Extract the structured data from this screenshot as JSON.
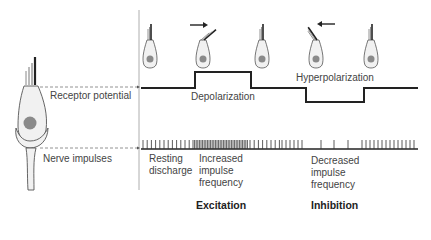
{
  "labels": {
    "receptor_potential": "Receptor potential",
    "nerve_impulses": "Nerve impulses",
    "depolarization": "Depolarization",
    "hyperpolarization": "Hyperpolarization",
    "resting_line1": "Resting",
    "resting_line2": "discharge",
    "increased_line1": "Increased",
    "increased_line2": "impulse",
    "increased_line3": "frequency",
    "decreased_line1": "Decreased",
    "decreased_line2": "impulse",
    "decreased_line3": "frequency",
    "excitation": "Excitation",
    "inhibition": "Inhibition"
  },
  "colors": {
    "line": "#222222",
    "cell_fill": "#f1f1f1",
    "nucleus": "#8a8a8a",
    "dashed": "#777777"
  },
  "hair_cells": [
    {
      "x": 150,
      "state": "rest",
      "arrow": "none"
    },
    {
      "x": 203,
      "state": "deflected-right",
      "arrow": "right"
    },
    {
      "x": 262,
      "state": "rest",
      "arrow": "none"
    },
    {
      "x": 316,
      "state": "deflected-left",
      "arrow": "left"
    },
    {
      "x": 371,
      "state": "rest",
      "arrow": "none"
    }
  ]
}
